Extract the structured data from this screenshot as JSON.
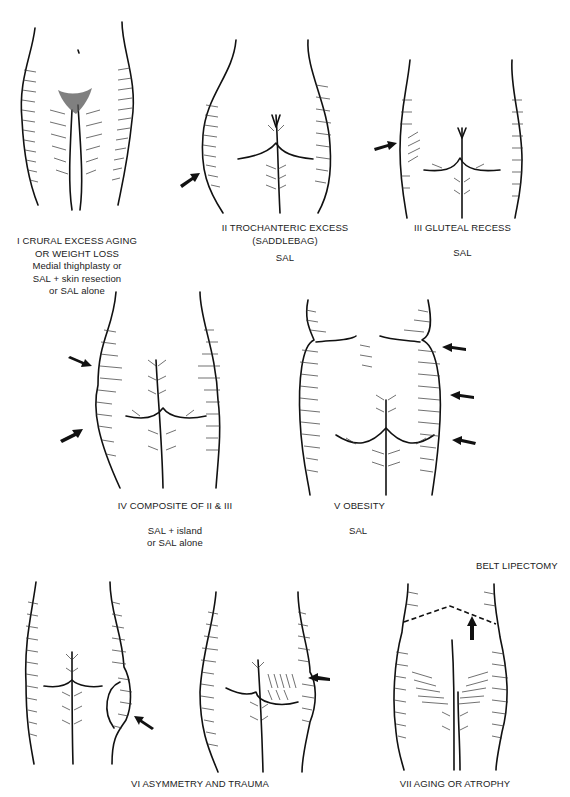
{
  "figure": {
    "panels": [
      {
        "id": "I",
        "title_line1": "I CRURAL EXCESS AGING",
        "title_line2": "OR WEIGHT LOSS",
        "treatment_line1": "Medial thighplasty or",
        "treatment_line2": "SAL + skin resection",
        "treatment_line3": "or SAL alone",
        "view": "anterior"
      },
      {
        "id": "II",
        "title_line1": "II TROCHANTERIC EXCESS",
        "title_line2": "(SADDLEBAG)",
        "treatment": "SAL",
        "view": "posterior",
        "arrows": 1
      },
      {
        "id": "III",
        "title": "III GLUTEAL RECESS",
        "treatment": "SAL",
        "view": "posterior",
        "arrows": 1
      },
      {
        "id": "IV",
        "title": "IV COMPOSITE OF II & III",
        "treatment_line1": "SAL + island",
        "treatment_line2": "or SAL alone",
        "view": "posterior",
        "arrows": 2
      },
      {
        "id": "V",
        "title": "V OBESITY",
        "treatment": "SAL",
        "view": "posterior",
        "arrows": 3
      },
      {
        "id": "VI",
        "title": "VI ASYMMETRY AND TRAUMA",
        "view": "posterior",
        "sub_figures": 2,
        "arrows": 2
      },
      {
        "id": "VII",
        "title": "VII AGING OR ATROPHY",
        "treatment": "BELT LIPECTOMY",
        "view": "posterior",
        "arrows": 1,
        "marking": "dashed-incision-line"
      }
    ]
  }
}
